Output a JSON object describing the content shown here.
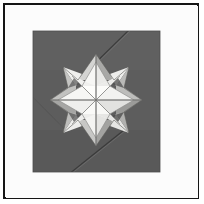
{
  "photo": {
    "subject": "origami eight-petal star flower fold",
    "frame_color": "#151515",
    "mat_color": "#fcfcfc",
    "background_paper_color": "#5d5d5d"
  },
  "palette": {
    "frame_line": "#151515",
    "mat": "#fcfcfc",
    "paper_dark": "#5d5d5d",
    "paper_dark_shade": "#565656",
    "paper_dark_highlight": "#6a6a6a",
    "petal_white": "#f6f6f4",
    "petal_white_dim": "#ececea",
    "petal_gray_light": "#cfcfcd",
    "petal_gray_mid": "#b3b3b1",
    "petal_gray_deep": "#9a9a98",
    "crease_line": "#8a8a88",
    "crease_line_dark": "#3a3a3a",
    "shadow_dark": "#4a4a4a"
  },
  "geometry": {
    "canvas": {
      "width": 204,
      "height": 204
    },
    "square": {
      "x": 33,
      "y": 31,
      "width": 127,
      "height": 141
    },
    "star_center": {
      "x": 96,
      "y": 100
    },
    "star_outer_radius": 46,
    "star_inner_radius": 26,
    "points": 8
  },
  "creases": [
    {
      "name": "upper-right-diagonal",
      "x1": 128,
      "y1": 31,
      "x2": 86,
      "y2": 72
    },
    {
      "name": "lower-left-diagonal",
      "x1": 33,
      "y1": 98,
      "x2": 60,
      "y2": 124
    },
    {
      "name": "lower-diagonal",
      "x1": 72,
      "y1": 172,
      "x2": 118,
      "y2": 136
    },
    {
      "name": "horizontal-center",
      "x1": 50,
      "y1": 100,
      "x2": 142,
      "y2": 100
    },
    {
      "name": "vertical-center",
      "x1": 96,
      "y1": 54,
      "x2": 96,
      "y2": 146
    }
  ]
}
